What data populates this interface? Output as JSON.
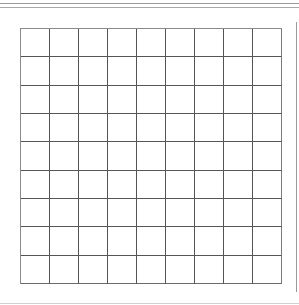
{
  "grid": {
    "rows": 9,
    "columns": 9,
    "line_color": "#555555",
    "cells": [
      [
        "",
        "",
        "",
        "",
        "",
        "",
        "",
        "",
        ""
      ],
      [
        "",
        "",
        "",
        "",
        "",
        "",
        "",
        "",
        ""
      ],
      [
        "",
        "",
        "",
        "",
        "",
        "",
        "",
        "",
        ""
      ],
      [
        "",
        "",
        "",
        "",
        "",
        "",
        "",
        "",
        ""
      ],
      [
        "",
        "",
        "",
        "",
        "",
        "",
        "",
        "",
        ""
      ],
      [
        "",
        "",
        "",
        "",
        "",
        "",
        "",
        "",
        ""
      ],
      [
        "",
        "",
        "",
        "",
        "",
        "",
        "",
        "",
        ""
      ],
      [
        "",
        "",
        "",
        "",
        "",
        "",
        "",
        "",
        ""
      ],
      [
        "",
        "",
        "",
        "",
        "",
        "",
        "",
        "",
        ""
      ]
    ]
  }
}
